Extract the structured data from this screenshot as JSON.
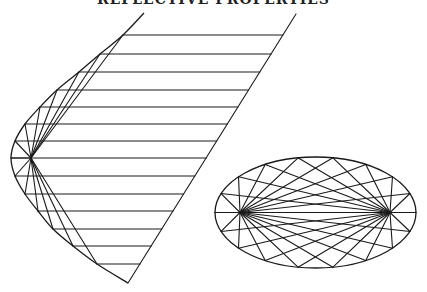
{
  "title": "REFLECTIVE PROPERTIES",
  "colors": {
    "stroke": "#1a1a1a",
    "background": "#ffffff"
  },
  "parabola": {
    "points": [
      [
        144,
        13
      ],
      [
        123,
        35
      ],
      [
        100,
        54
      ],
      [
        79,
        72
      ],
      [
        57,
        90
      ],
      [
        40,
        107
      ],
      [
        25,
        124
      ],
      [
        15,
        141
      ],
      [
        11,
        158
      ],
      [
        15,
        176
      ],
      [
        25,
        194
      ],
      [
        38,
        211
      ],
      [
        53,
        229
      ],
      [
        73,
        246
      ],
      [
        97,
        264
      ],
      [
        128,
        283
      ]
    ],
    "focus": [
      31,
      158
    ],
    "ray_point_indices": [
      1,
      2,
      3,
      4,
      5,
      6,
      7,
      8,
      9,
      10,
      11,
      12,
      13,
      14
    ],
    "parallel_line": {
      "top": [
        296,
        14
      ],
      "bottom": [
        128,
        283
      ]
    }
  },
  "ellipse": {
    "center": [
      315.5,
      212.5
    ],
    "rx": 100.5,
    "ry": 55.5,
    "foci": [
      [
        240,
        212.5
      ],
      [
        390,
        212.5
      ]
    ],
    "point_count": 18
  }
}
